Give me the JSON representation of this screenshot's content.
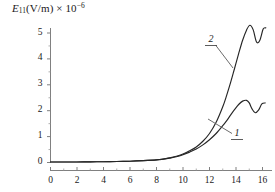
{
  "chart_data": {
    "type": "line",
    "title": "",
    "subtitle": "",
    "ylabel": "E11(V/m) x 10^-6",
    "xlabel": "",
    "grid": false,
    "legend_position": "inline-annotation",
    "xlim": [
      0,
      16
    ],
    "ylim": [
      0,
      5.6
    ],
    "x_ticks": [
      0,
      2,
      4,
      6,
      8,
      10,
      12,
      14,
      16
    ],
    "x_tick_labels": [
      "0",
      "2",
      "4",
      "6",
      "8",
      "10",
      "12",
      "14",
      "16"
    ],
    "x_minor_tick_step": 1,
    "y_ticks": [
      0,
      1,
      2,
      3,
      4,
      5
    ],
    "y_tick_labels": [
      "0",
      "1",
      "2",
      "3",
      "4",
      "5"
    ],
    "y_minor_tick_step": 0.5,
    "annotations": [
      {
        "text": "2",
        "series": "2"
      },
      {
        "text": "1",
        "series": "1"
      }
    ],
    "series": [
      {
        "name": "1",
        "label": "1",
        "color": "#262626",
        "x": [
          0,
          1,
          2,
          3,
          4,
          5,
          6,
          7,
          8,
          8.5,
          9,
          9.5,
          10,
          10.5,
          11,
          11.5,
          12,
          12.5,
          13,
          13.3,
          13.6,
          13.9,
          14.2,
          14.5,
          14.8,
          15.0,
          15.2,
          15.45,
          15.7,
          15.95,
          16.2
        ],
        "y": [
          0.02,
          0.02,
          0.02,
          0.025,
          0.03,
          0.04,
          0.05,
          0.07,
          0.1,
          0.13,
          0.17,
          0.22,
          0.3,
          0.4,
          0.52,
          0.68,
          0.88,
          1.12,
          1.42,
          1.62,
          1.84,
          2.05,
          2.24,
          2.37,
          2.4,
          2.3,
          2.08,
          1.92,
          2.02,
          2.26,
          2.3
        ]
      },
      {
        "name": "2",
        "label": "2",
        "color": "#262626",
        "x": [
          0,
          1,
          2,
          3,
          4,
          5,
          6,
          7,
          8,
          8.5,
          9,
          9.5,
          10,
          10.5,
          11,
          11.5,
          12,
          12.5,
          13,
          13.3,
          13.6,
          13.9,
          14.2,
          14.5,
          14.8,
          15.05,
          15.3,
          15.55,
          15.8,
          16.05,
          16.25
        ],
        "y": [
          0.02,
          0.02,
          0.02,
          0.025,
          0.03,
          0.04,
          0.05,
          0.07,
          0.1,
          0.13,
          0.18,
          0.24,
          0.33,
          0.45,
          0.6,
          0.82,
          1.12,
          1.55,
          2.15,
          2.6,
          3.1,
          3.65,
          4.2,
          4.72,
          5.12,
          5.3,
          5.12,
          4.65,
          4.72,
          5.15,
          5.2
        ]
      }
    ]
  },
  "axis": {
    "y_title_main": "E",
    "y_title_sub": "11",
    "y_title_unit": "(V/m)",
    "y_title_mult": "× 10",
    "y_title_exp": "−6"
  }
}
